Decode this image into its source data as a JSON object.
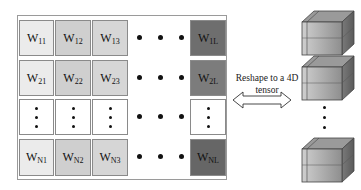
{
  "matrix": {
    "rows": [
      {
        "cells": [
          {
            "base": "W",
            "sub": "11"
          },
          {
            "base": "W",
            "sub": "12"
          },
          {
            "base": "W",
            "sub": "13"
          }
        ],
        "last": {
          "base": "W",
          "sub": "1L"
        }
      },
      {
        "cells": [
          {
            "base": "W",
            "sub": "21"
          },
          {
            "base": "W",
            "sub": "22"
          },
          {
            "base": "W",
            "sub": "23"
          }
        ],
        "last": {
          "base": "W",
          "sub": "2L"
        }
      },
      {
        "cells": [
          {
            "base": "⋮",
            "sub": ""
          },
          {
            "base": "⋮",
            "sub": ""
          },
          {
            "base": "⋮",
            "sub": ""
          }
        ],
        "last": {
          "base": "⋮",
          "sub": ""
        }
      },
      {
        "cells": [
          {
            "base": "W",
            "sub": "N1"
          },
          {
            "base": "W",
            "sub": "N2"
          },
          {
            "base": "W",
            "sub": "N3"
          }
        ],
        "last": {
          "base": "W",
          "sub": "NL"
        }
      }
    ],
    "colors": {
      "col1": "#ebebeb",
      "col2": "#cfcfcf",
      "col3": "#d6d6d6",
      "last": "#6e6e6e",
      "border": "#8a8a8a"
    }
  },
  "transform": {
    "label_line1": "Reshape to a 4D",
    "label_line2": "tensor",
    "arrow": "double-headed-arrow"
  },
  "tensor": {
    "cubes": 3,
    "ellipsis": "vertical-dots"
  }
}
